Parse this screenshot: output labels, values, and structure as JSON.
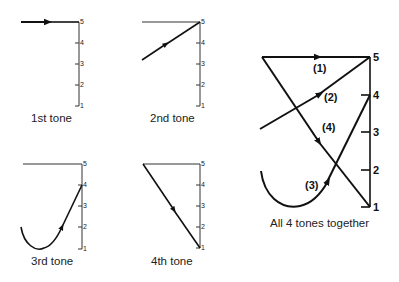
{
  "panels": [
    {
      "id": "tone1",
      "caption": "1st tone",
      "ticks": [
        "5",
        "4",
        "3",
        "2",
        "1"
      ]
    },
    {
      "id": "tone2",
      "caption": "2nd tone",
      "ticks": [
        "5",
        "4",
        "3",
        "2",
        "1"
      ]
    },
    {
      "id": "tone3",
      "caption": "3rd tone",
      "ticks": [
        "5",
        "4",
        "3",
        "2",
        "1"
      ]
    },
    {
      "id": "tone4",
      "caption": "4th tone",
      "ticks": [
        "5",
        "4",
        "3",
        "2",
        "1"
      ]
    }
  ],
  "combined": {
    "caption": "All 4 tones together",
    "ticks": [
      "5",
      "4",
      "3",
      "2",
      "1"
    ],
    "labels": [
      "(1)",
      "(2)",
      "(3)",
      "(4)"
    ]
  },
  "colors": {
    "stroke": "#111111",
    "background": "#ffffff"
  }
}
